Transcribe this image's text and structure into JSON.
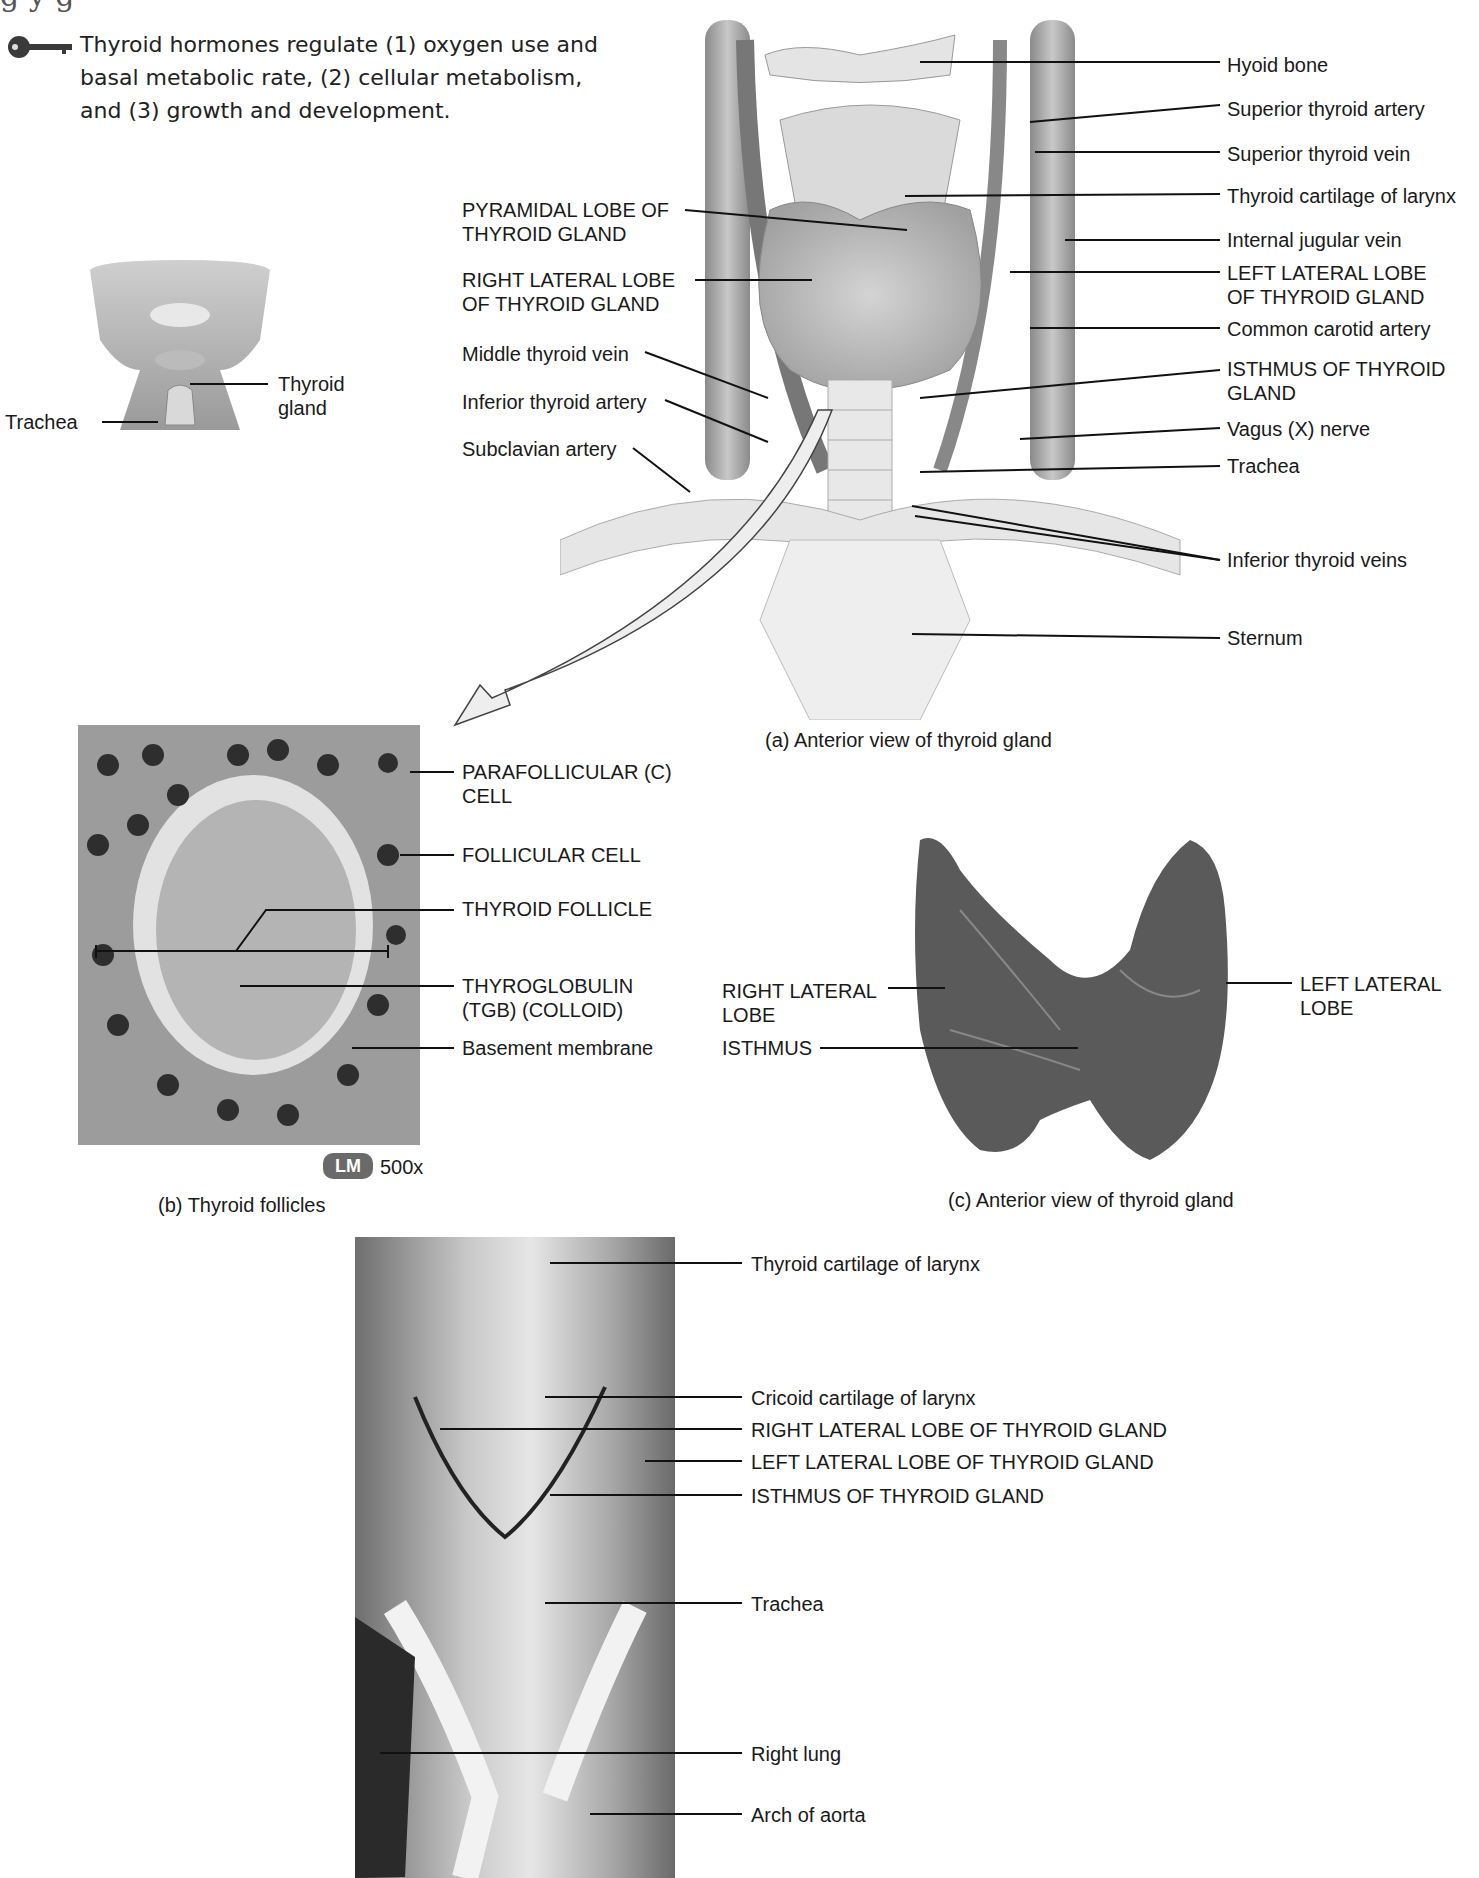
{
  "header": {
    "heading_fragment": "g                   y  g",
    "key_icon": "key-icon",
    "intro_text": "Thyroid hormones regulate (1) oxygen use and basal metabolic rate, (2) cellular metabolism, and (3) growth and development."
  },
  "inset": {
    "labels": {
      "thyroid_gland": "Thyroid\ngland",
      "trachea": "Trachea"
    }
  },
  "panel_a": {
    "caption": "(a) Anterior view of thyroid gland",
    "left_labels": {
      "pyramidal_lobe": "PYRAMIDAL LOBE OF\nTHYROID GLAND",
      "right_lateral_lobe": "RIGHT LATERAL LOBE\nOF THYROID GLAND",
      "middle_thyroid_vein": "Middle thyroid vein",
      "inferior_thyroid_artery": "Inferior thyroid artery",
      "subclavian_artery": "Subclavian artery"
    },
    "right_labels": {
      "hyoid_bone": "Hyoid bone",
      "superior_thyroid_artery": "Superior thyroid artery",
      "superior_thyroid_vein": "Superior thyroid vein",
      "thyroid_cartilage": "Thyroid cartilage of larynx",
      "internal_jugular_vein": "Internal jugular vein",
      "left_lateral_lobe": "LEFT LATERAL LOBE\nOF THYROID GLAND",
      "common_carotid_artery": "Common carotid artery",
      "isthmus": "ISTHMUS OF THYROID\nGLAND",
      "vagus_nerve": "Vagus (X) nerve",
      "trachea": "Trachea",
      "inferior_thyroid_veins": "Inferior thyroid veins",
      "sternum": "Sternum"
    }
  },
  "panel_b": {
    "caption": "(b) Thyroid follicles",
    "badge": "LM",
    "magnification": "500x",
    "labels": {
      "parafollicular_cell": "PARAFOLLICULAR (C)\nCELL",
      "follicular_cell": "FOLLICULAR CELL",
      "thyroid_follicle": "THYROID FOLLICLE",
      "thyroglobulin": "THYROGLOBULIN\n(TGB) (COLLOID)",
      "basement_membrane": "Basement membrane"
    }
  },
  "panel_c": {
    "caption": "(c) Anterior view of thyroid gland",
    "labels": {
      "right_lateral_lobe": "RIGHT LATERAL\nLOBE",
      "isthmus": "ISTHMUS",
      "left_lateral_lobe": "LEFT LATERAL\nLOBE"
    }
  },
  "panel_d": {
    "labels": {
      "thyroid_cartilage": "Thyroid cartilage of larynx",
      "cricoid_cartilage": "Cricoid cartilage of larynx",
      "right_lateral_lobe": "RIGHT LATERAL LOBE OF THYROID GLAND",
      "left_lateral_lobe": "LEFT LATERAL LOBE OF THYROID GLAND",
      "isthmus": "ISTHMUS OF THYROID GLAND",
      "trachea": "Trachea",
      "right_lung": "Right lung",
      "arch_of_aorta": "Arch of aorta"
    }
  }
}
